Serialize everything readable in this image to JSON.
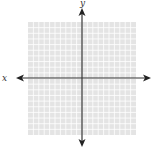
{
  "diagram": {
    "type": "coordinate-plane",
    "x_axis_label": "x",
    "y_axis_label": "y",
    "grid": {
      "columns": 20,
      "rows": 20,
      "line_color": "#ffffff",
      "background": "#e6e6e6"
    },
    "axis_color": "#333333"
  }
}
